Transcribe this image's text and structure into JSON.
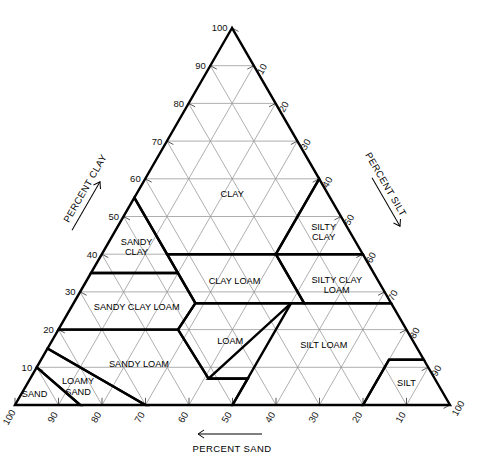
{
  "figure": {
    "type": "soil-texture-triangle"
  },
  "axes": {
    "left": {
      "title": "PERCENT CLAY",
      "arrow_direction": "up-right",
      "ticks": [
        10,
        20,
        30,
        40,
        50,
        60,
        70,
        80,
        90,
        100
      ],
      "rotated_labels": false
    },
    "right": {
      "title": "PERCENT SILT",
      "arrow_direction": "down-right",
      "ticks": [
        10,
        20,
        30,
        40,
        50,
        60,
        70,
        80,
        90,
        100
      ],
      "rotated_labels": true
    },
    "bottom": {
      "title": "PERCENT SAND",
      "arrow_direction": "left",
      "ticks": [
        100,
        90,
        80,
        70,
        60,
        50,
        40,
        30,
        20,
        10
      ],
      "rotated_labels": true
    }
  },
  "classes": [
    {
      "name": "CLAY",
      "lines": [
        "CLAY"
      ],
      "clay": 56,
      "sand": 22,
      "silt": 22
    },
    {
      "name": "SILTY CLAY",
      "lines": [
        "SILTY",
        "CLAY"
      ],
      "clay": 46,
      "sand": 6,
      "silt": 48
    },
    {
      "name": "SANDY CLAY",
      "lines": [
        "SANDY",
        "CLAY"
      ],
      "clay": 42,
      "sand": 51,
      "silt": 7
    },
    {
      "name": "CLAY LOAM",
      "lines": [
        "CLAY LOAM"
      ],
      "clay": 33,
      "sand": 33,
      "silt": 34
    },
    {
      "name": "SILTY CLAY LOAM",
      "lines": [
        "SILTY CLAY",
        "LOAM"
      ],
      "clay": 32,
      "sand": 10,
      "silt": 58
    },
    {
      "name": "SANDY CLAY LOAM",
      "lines": [
        "SANDY CLAY LOAM"
      ],
      "clay": 26,
      "sand": 59,
      "silt": 15
    },
    {
      "name": "LOAM",
      "lines": [
        "LOAM"
      ],
      "clay": 17,
      "sand": 42,
      "silt": 41
    },
    {
      "name": "SILT LOAM",
      "lines": [
        "SILT LOAM"
      ],
      "clay": 16,
      "sand": 21,
      "silt": 63
    },
    {
      "name": "SANDY LOAM",
      "lines": [
        "SANDY LOAM"
      ],
      "clay": 11,
      "sand": 66,
      "silt": 23
    },
    {
      "name": "SILT",
      "lines": [
        "SILT"
      ],
      "clay": 6,
      "sand": 7,
      "silt": 87
    },
    {
      "name": "LOAMY SAND",
      "lines": [
        "LOAMY",
        "SAND"
      ],
      "clay": 5,
      "sand": 83,
      "silt": 12
    },
    {
      "name": "SAND",
      "lines": [
        "SAND"
      ],
      "clay": 3,
      "sand": 94,
      "silt": 3
    }
  ],
  "chart_data": {
    "type": "ternary",
    "components": [
      "PERCENT CLAY",
      "PERCENT SILT",
      "PERCENT SAND"
    ],
    "axis_range": [
      0,
      100
    ],
    "tick_step": 10,
    "grid": true,
    "class_boundaries": [
      {
        "name": "CLAY",
        "vertices": [
          [
            100,
            0,
            0
          ],
          [
            55,
            45,
            0
          ],
          [
            40,
            45,
            15
          ],
          [
            40,
            20,
            40
          ],
          [
            60,
            0,
            40
          ]
        ]
      },
      {
        "name": "SILTY CLAY",
        "vertices": [
          [
            60,
            0,
            40
          ],
          [
            40,
            0,
            60
          ],
          [
            40,
            20,
            40
          ]
        ]
      },
      {
        "name": "SANDY CLAY",
        "vertices": [
          [
            55,
            45,
            0
          ],
          [
            35,
            65,
            0
          ],
          [
            35,
            45,
            20
          ],
          [
            40,
            45,
            15
          ]
        ]
      },
      {
        "name": "SILTY CLAY LOAM",
        "vertices": [
          [
            40,
            0,
            60
          ],
          [
            27,
            0,
            73
          ],
          [
            27,
            20,
            53
          ],
          [
            40,
            20,
            40
          ]
        ]
      },
      {
        "name": "CLAY LOAM",
        "vertices": [
          [
            40,
            20,
            40
          ],
          [
            27,
            20,
            53
          ],
          [
            27,
            45,
            28
          ],
          [
            40,
            45,
            15
          ]
        ]
      },
      {
        "name": "SANDY CLAY LOAM",
        "vertices": [
          [
            35,
            45,
            20
          ],
          [
            35,
            65,
            0
          ],
          [
            20,
            80,
            0
          ],
          [
            20,
            52.5,
            27.5
          ],
          [
            27,
            45,
            28
          ]
        ]
      },
      {
        "name": "LOAM",
        "vertices": [
          [
            27,
            45,
            28
          ],
          [
            20,
            52.5,
            27.5
          ],
          [
            7,
            52,
            41
          ],
          [
            7,
            43,
            50
          ],
          [
            27,
            23,
            50
          ]
        ]
      },
      {
        "name": "SILT LOAM",
        "vertices": [
          [
            27,
            0,
            73
          ],
          [
            12,
            0,
            88
          ],
          [
            12,
            8,
            80
          ],
          [
            0,
            20,
            80
          ],
          [
            0,
            50,
            50
          ],
          [
            7,
            43,
            50
          ],
          [
            7,
            52,
            41
          ],
          [
            27,
            23,
            50
          ]
        ]
      },
      {
        "name": "SILT",
        "vertices": [
          [
            12,
            0,
            88
          ],
          [
            0,
            0,
            100
          ],
          [
            0,
            20,
            80
          ],
          [
            12,
            8,
            80
          ]
        ]
      },
      {
        "name": "SANDY LOAM",
        "vertices": [
          [
            20,
            80,
            0
          ],
          [
            20,
            52.5,
            27.5
          ],
          [
            7,
            52,
            41
          ],
          [
            7,
            43,
            50
          ],
          [
            0,
            50,
            50
          ],
          [
            0,
            70,
            30
          ],
          [
            15,
            85,
            0
          ]
        ]
      },
      {
        "name": "LOAMY SAND",
        "vertices": [
          [
            15,
            85,
            0
          ],
          [
            0,
            70,
            30
          ],
          [
            0,
            85,
            15
          ],
          [
            10,
            90,
            0
          ]
        ]
      },
      {
        "name": "SAND",
        "vertices": [
          [
            10,
            90,
            0
          ],
          [
            0,
            85,
            15
          ],
          [
            0,
            100,
            0
          ]
        ]
      }
    ]
  }
}
